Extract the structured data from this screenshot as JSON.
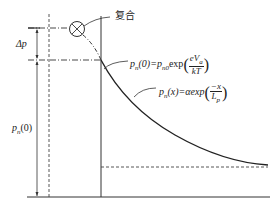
{
  "diagram": {
    "labels": {
      "recombination": "复合",
      "delta_p": "Δp",
      "pn0_axis": "p",
      "pn0_axis_sub": "n",
      "pn0_axis_arg": "(0)",
      "eq1_lhs": "p",
      "eq1_lhs_sub": "n",
      "eq1_lhs_arg": "(0)=p",
      "eq1_rhs_sub": "n0",
      "eq1_exp": "exp",
      "eq1_num": "eV",
      "eq1_num_sub": "a",
      "eq1_den": "kT",
      "eq2_lhs": "p",
      "eq2_lhs_sub": "n",
      "eq2_arg": "(x)=αexp",
      "eq2_num": "−x",
      "eq2_den": "L",
      "eq2_den_sub": "p"
    },
    "colors": {
      "line": "#222222",
      "background": "#ffffff"
    }
  }
}
